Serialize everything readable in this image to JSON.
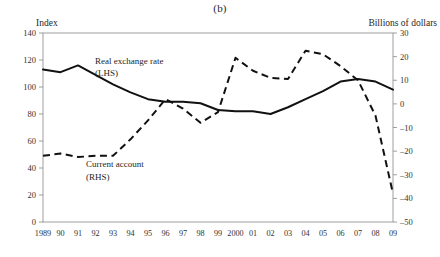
{
  "figure": {
    "title": "(b)",
    "left_axis_title": "Index",
    "right_axis_title": "Billions of dollars"
  },
  "annotations": {
    "series1_label_line1": "Real exchange rate",
    "series1_label_line2": "(LHS)",
    "series2_label_line1": "Current account",
    "series2_label_line2": "(RHS)"
  },
  "chart_data": {
    "type": "line",
    "title": "(b)",
    "xlabel": "",
    "ylabel": "Index",
    "y2label": "Billions of dollars",
    "grid": false,
    "legend_position": "inline-annotation",
    "x": [
      "1989",
      "90",
      "91",
      "92",
      "93",
      "94",
      "95",
      "96",
      "97",
      "98",
      "99",
      "2000",
      "01",
      "02",
      "03",
      "04",
      "05",
      "06",
      "07",
      "08",
      "09"
    ],
    "ylim": [
      0,
      140
    ],
    "yticks": [
      0,
      20,
      40,
      60,
      80,
      100,
      120,
      140
    ],
    "y2lim": [
      -50,
      30
    ],
    "y2ticks": [
      -50,
      -40,
      -30,
      -20,
      -10,
      0,
      10,
      20,
      30
    ],
    "series": [
      {
        "name": "Real exchange rate (LHS)",
        "axis": "left",
        "style": "solid",
        "color": "#111111",
        "values": [
          113,
          111,
          116,
          109,
          102,
          96,
          91,
          89,
          89,
          88,
          83,
          82,
          82,
          80,
          85,
          91,
          97,
          104,
          106,
          104,
          98
        ]
      },
      {
        "name": "Current account (RHS)",
        "axis": "right",
        "style": "dashed",
        "color": "#111111",
        "values": [
          -22,
          -21,
          -22.5,
          -22,
          -22,
          -15,
          -7,
          2,
          -2,
          -8,
          -3.5,
          19.5,
          14,
          11,
          10.5,
          22.5,
          21,
          16,
          10,
          -5,
          -38
        ]
      }
    ]
  }
}
